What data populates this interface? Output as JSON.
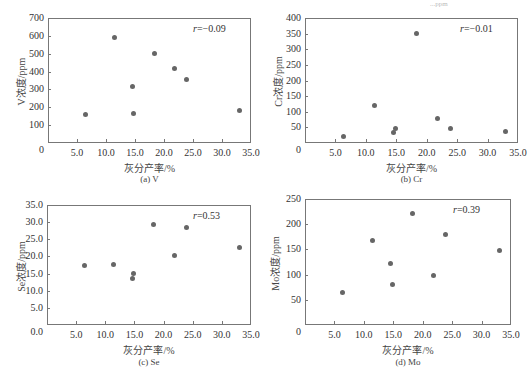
{
  "top_fragment": "...ppm",
  "chart_data": [
    {
      "id": "a",
      "type": "scatter",
      "caption": "(a)  V",
      "xlabel": "灰分产率/%",
      "ylabel": "V浓度/ppm",
      "annotation": "r=−0.09",
      "r_symbol": "r",
      "r_value": "=−0.09",
      "xlim": [
        0,
        35
      ],
      "ylim": [
        0,
        700
      ],
      "xticks": [
        "5.0",
        "10.0",
        "15.0",
        "20.0",
        "25.0",
        "30.0",
        "35.0"
      ],
      "yticks": [
        "700",
        "600",
        "500",
        "400",
        "300",
        "200",
        "100"
      ],
      "origin_label": "0",
      "grid": false,
      "points": [
        {
          "x": 6.4,
          "y": 160
        },
        {
          "x": 11.4,
          "y": 592
        },
        {
          "x": 14.6,
          "y": 318
        },
        {
          "x": 14.8,
          "y": 163
        },
        {
          "x": 18.3,
          "y": 503
        },
        {
          "x": 21.8,
          "y": 420
        },
        {
          "x": 23.9,
          "y": 357
        },
        {
          "x": 33.0,
          "y": 182
        }
      ]
    },
    {
      "id": "b",
      "type": "scatter",
      "caption": "(b)  Cr",
      "xlabel": "灰分产率/%",
      "ylabel": "Cr浓度/ppm",
      "annotation": "r=−0.01",
      "r_symbol": "r",
      "r_value": "=−0.01",
      "xlim": [
        0,
        35
      ],
      "ylim": [
        0,
        400
      ],
      "xticks": [
        "5.0",
        "10.0",
        "15.0",
        "20.0",
        "25.0",
        "30.0",
        "35.0"
      ],
      "yticks": [
        "400",
        "350",
        "300",
        "250",
        "200",
        "150",
        "100",
        "50"
      ],
      "origin_label": "0",
      "grid": false,
      "points": [
        {
          "x": 6.4,
          "y": 20
        },
        {
          "x": 11.4,
          "y": 120
        },
        {
          "x": 14.6,
          "y": 35
        },
        {
          "x": 14.8,
          "y": 45
        },
        {
          "x": 18.3,
          "y": 350
        },
        {
          "x": 21.8,
          "y": 80
        },
        {
          "x": 23.9,
          "y": 45
        },
        {
          "x": 33.0,
          "y": 37
        }
      ]
    },
    {
      "id": "c",
      "type": "scatter",
      "caption": "(c)  Se",
      "xlabel": "灰分产率/%",
      "ylabel": "Se浓度/ppm",
      "annotation": "r=0.53",
      "r_symbol": "r",
      "r_value": "=0.53",
      "xlim": [
        0,
        35
      ],
      "ylim": [
        0,
        35
      ],
      "xticks": [
        "5.0",
        "10.0",
        "15.0",
        "20.0",
        "25.0",
        "30.0",
        "35.0"
      ],
      "yticks": [
        "35.0",
        "30.0",
        "25.0",
        "20.0",
        "15.0",
        "10.0",
        "5.0"
      ],
      "origin_label": "0.0",
      "grid": false,
      "points": [
        {
          "x": 6.4,
          "y": 17.4
        },
        {
          "x": 11.4,
          "y": 17.7
        },
        {
          "x": 14.6,
          "y": 13.7
        },
        {
          "x": 14.8,
          "y": 15.0
        },
        {
          "x": 18.3,
          "y": 29.3
        },
        {
          "x": 21.8,
          "y": 20.3
        },
        {
          "x": 23.9,
          "y": 28.4
        },
        {
          "x": 33.0,
          "y": 22.7
        }
      ]
    },
    {
      "id": "d",
      "type": "scatter",
      "caption": "(d)  Mo",
      "xlabel": "灰分产率/%",
      "ylabel": "Mo浓度/ppm",
      "annotation": "r=0.39",
      "r_symbol": "r",
      "r_value": "=0.39",
      "xlim": [
        0,
        35
      ],
      "ylim": [
        0,
        250
      ],
      "xticks": [
        "5.0",
        "10.0",
        "15.0",
        "20.0",
        "25.0",
        "30.0",
        "35.0"
      ],
      "yticks": [
        "250",
        "200",
        "150",
        "100",
        "50"
      ],
      "origin_label": "0",
      "grid": false,
      "points": [
        {
          "x": 6.4,
          "y": 64
        },
        {
          "x": 11.4,
          "y": 168
        },
        {
          "x": 14.6,
          "y": 123
        },
        {
          "x": 14.8,
          "y": 80
        },
        {
          "x": 18.3,
          "y": 221
        },
        {
          "x": 21.8,
          "y": 99
        },
        {
          "x": 23.9,
          "y": 180
        },
        {
          "x": 33.0,
          "y": 148
        }
      ]
    }
  ]
}
